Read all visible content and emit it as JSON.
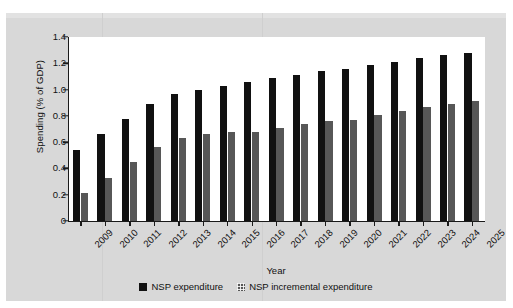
{
  "chart_data": {
    "type": "bar",
    "title": "",
    "xlabel": "Year",
    "ylabel": "Spending (% of GDP)",
    "ylim": [
      0,
      1.4
    ],
    "yticks": [
      0,
      0.2,
      0.4,
      0.6,
      0.8,
      1.0,
      1.2,
      1.4
    ],
    "ytick_labels": [
      "0",
      "0.2",
      "0.4",
      "0.6",
      "0.8",
      "1.0",
      "1.2",
      "1.4"
    ],
    "grid": false,
    "legend_position": "bottom-center",
    "categories": [
      "2009",
      "2010",
      "2011",
      "2012",
      "2013",
      "2014",
      "2015",
      "2016",
      "2017",
      "2018",
      "2019",
      "2020",
      "2021",
      "2022",
      "2023",
      "2024",
      "2025"
    ],
    "series": [
      {
        "name": "NSP expenditure",
        "color": "#111111",
        "values": [
          0.54,
          0.66,
          0.78,
          0.89,
          0.97,
          1.0,
          1.03,
          1.06,
          1.09,
          1.11,
          1.14,
          1.16,
          1.19,
          1.21,
          1.24,
          1.26,
          1.28
        ]
      },
      {
        "name": "NSP incremental expenditure",
        "color": "#575757",
        "values": [
          0.21,
          0.33,
          0.45,
          0.56,
          0.63,
          0.66,
          0.68,
          0.68,
          0.71,
          0.74,
          0.76,
          0.77,
          0.81,
          0.84,
          0.87,
          0.89,
          0.91
        ]
      }
    ]
  },
  "legend": {
    "items": [
      {
        "label": "NSP expenditure"
      },
      {
        "label": "NSP incremental expenditure"
      }
    ]
  },
  "colors": {
    "primary_series": "#111111",
    "secondary_series": "#575757",
    "page_background": "#d8d8d8",
    "plot_background": "#ffffff",
    "axis": "#1a1a1a"
  }
}
